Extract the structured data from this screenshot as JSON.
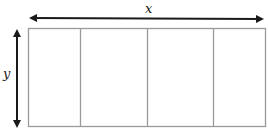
{
  "diagram": {
    "type": "dimensioned-rectangle",
    "labels": {
      "width": "x",
      "height": "y"
    },
    "rectangle": {
      "x": 28,
      "y": 28,
      "width": 238,
      "height": 99,
      "stroke": "#9a9a9a",
      "sections": 4,
      "divider_x": [
        80,
        147,
        213
      ]
    },
    "arrows": {
      "horizontal": {
        "x1": 29,
        "x2": 264,
        "y": 18,
        "color": "#1a1a1a"
      },
      "vertical": {
        "x": 17,
        "y1": 29,
        "y2": 128,
        "color": "#1a1a1a"
      }
    }
  }
}
